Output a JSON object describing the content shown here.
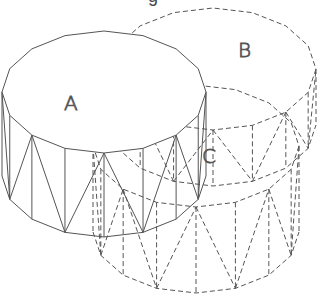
{
  "title_fragment": "g",
  "style": {
    "stroke": "#555555",
    "background": "#ffffff",
    "dash": "5,3"
  },
  "cylinders": [
    {
      "id": "A",
      "label": "A",
      "cx": 104,
      "cy": 92,
      "rx": 102,
      "ry": 61,
      "height": 84,
      "solid": true,
      "label_pos": [
        64,
        110
      ],
      "segments": 16
    },
    {
      "id": "B",
      "label": "B",
      "cx": 213,
      "cy": 69,
      "rx": 103,
      "ry": 61,
      "height": 56,
      "solid": false,
      "label_pos": [
        238,
        57
      ],
      "segments": 16
    },
    {
      "id": "C",
      "label": "C",
      "cx": 196,
      "cy": 146,
      "rx": 103,
      "ry": 61,
      "height": 86,
      "solid": false,
      "label_pos": [
        202,
        163
      ],
      "segments": 16
    }
  ]
}
